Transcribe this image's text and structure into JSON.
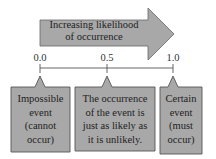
{
  "diagram": {
    "arrow": {
      "label_line1": "Increasing likelihood",
      "label_line2": "of occurrence",
      "fill": "#a8a8a8"
    },
    "scale": {
      "ticks": [
        {
          "label": "0.0",
          "x": 40
        },
        {
          "label": "0.5",
          "x": 107
        },
        {
          "label": "1.0",
          "x": 173
        }
      ]
    },
    "boxes": [
      {
        "lines": [
          "Impossible",
          "event",
          "(cannot",
          "occur)"
        ]
      },
      {
        "lines": [
          "The occurrence",
          "of the event is",
          "just as likely as",
          "it is unlikely."
        ]
      },
      {
        "lines": [
          "Certain",
          "event",
          "(must",
          "occur)"
        ]
      }
    ],
    "colors": {
      "box_fill": "#a8a8a8",
      "stroke": "#555555",
      "text": "#222222"
    }
  }
}
